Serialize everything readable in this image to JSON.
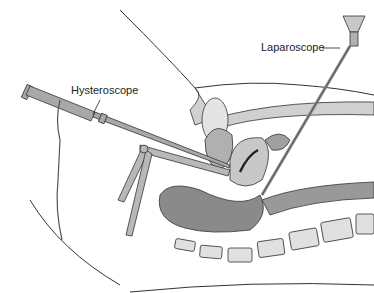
{
  "figure": {
    "labels": {
      "laparoscope": "Laparoscope",
      "hysteroscope": "Hysteroscope"
    },
    "colors": {
      "line": "#333333",
      "tissue_light": "#d8d8d8",
      "tissue_mid": "#a8a8a8",
      "tissue_dark": "#6e6e6e",
      "instrument": "#9a9a9a",
      "background": "#ffffff"
    }
  }
}
